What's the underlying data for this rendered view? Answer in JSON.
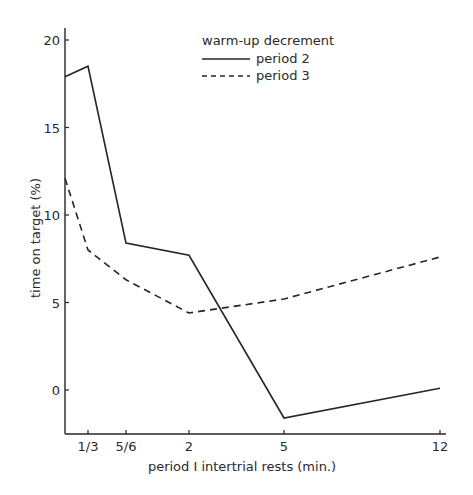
{
  "chart_data": {
    "type": "line",
    "title": "",
    "xlabel": "period I intertrial rests (min.)",
    "ylabel": "time on target (%)",
    "x_tick_labels": [
      "1/3",
      "5/6",
      "2",
      "5",
      "12"
    ],
    "y_ticks": [
      0,
      5,
      10,
      15,
      20
    ],
    "ylim": [
      -2.5,
      21
    ],
    "grid": false,
    "legend": {
      "title": "warm-up decrement",
      "position": "top-right",
      "entries": [
        {
          "label": "period 2",
          "style": "solid"
        },
        {
          "label": "period 3",
          "style": "dashed"
        }
      ]
    },
    "categories": [
      "0",
      "1/3",
      "5/6",
      "2",
      "5",
      "12"
    ],
    "series": [
      {
        "name": "period 2",
        "style": "solid",
        "values": [
          17.9,
          18.5,
          8.4,
          7.7,
          -1.6,
          0.1
        ]
      },
      {
        "name": "period 3",
        "style": "dashed",
        "values": [
          12.1,
          8.0,
          6.3,
          4.4,
          5.2,
          7.6
        ]
      }
    ]
  },
  "layout": {
    "plot_x0": 65,
    "x_positions": [
      65,
      88,
      126,
      189,
      284,
      440
    ],
    "y_zero_px": 390,
    "px_per_unit": 17.5,
    "x_axis_y": 434,
    "y_axis_top": 28,
    "x_axis_right": 446,
    "line_color": "#262626"
  }
}
